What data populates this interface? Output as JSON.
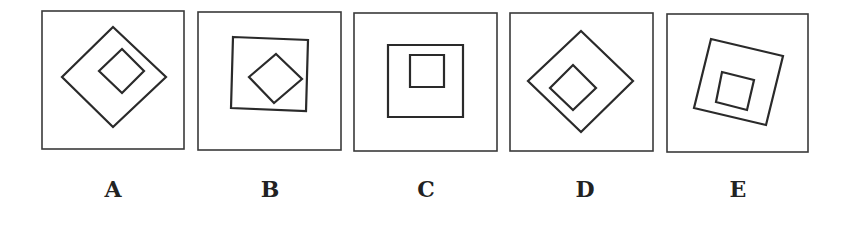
{
  "figure": {
    "options": [
      {
        "label": "A",
        "frame": {
          "x": 42,
          "y": 11,
          "w": 142,
          "h": 138
        },
        "shapes": [
          {
            "type": "diamond",
            "points": [
              [
                113,
                27
              ],
              [
                166,
                77
              ],
              [
                113,
                127
              ],
              [
                62,
                77
              ]
            ]
          },
          {
            "type": "diamond",
            "points": [
              [
                122,
                49
              ],
              [
                144,
                71
              ],
              [
                122,
                93
              ],
              [
                99,
                71
              ]
            ]
          }
        ]
      },
      {
        "label": "B",
        "frame": {
          "x": 198,
          "y": 12,
          "w": 143,
          "h": 138
        },
        "shapes": [
          {
            "type": "square",
            "points": [
              [
                233,
                37
              ],
              [
                308,
                40
              ],
              [
                306,
                111
              ],
              [
                231,
                108
              ]
            ]
          },
          {
            "type": "diamond",
            "points": [
              [
                276,
                54
              ],
              [
                302,
                79
              ],
              [
                274,
                103
              ],
              [
                249,
                77
              ]
            ]
          }
        ]
      },
      {
        "label": "C",
        "frame": {
          "x": 354,
          "y": 13,
          "w": 143,
          "h": 138
        },
        "shapes": [
          {
            "type": "square",
            "points": [
              [
                388,
                45
              ],
              [
                463,
                45
              ],
              [
                463,
                117
              ],
              [
                388,
                117
              ]
            ]
          },
          {
            "type": "square",
            "points": [
              [
                410,
                55
              ],
              [
                444,
                55
              ],
              [
                444,
                87
              ],
              [
                410,
                87
              ]
            ]
          }
        ]
      },
      {
        "label": "D",
        "frame": {
          "x": 510,
          "y": 13,
          "w": 143,
          "h": 138
        },
        "shapes": [
          {
            "type": "diamond",
            "points": [
              [
                581,
                31
              ],
              [
                633,
                81
              ],
              [
                581,
                132
              ],
              [
                528,
                81
              ]
            ]
          },
          {
            "type": "diamond",
            "points": [
              [
                573,
                65
              ],
              [
                596,
                88
              ],
              [
                573,
                110
              ],
              [
                550,
                88
              ]
            ]
          }
        ]
      },
      {
        "label": "E",
        "frame": {
          "x": 667,
          "y": 14,
          "w": 141,
          "h": 138
        },
        "shapes": [
          {
            "type": "square",
            "points": [
              [
                711,
                39
              ],
              [
                783,
                56
              ],
              [
                766,
                125
              ],
              [
                694,
                108
              ]
            ]
          },
          {
            "type": "square",
            "points": [
              [
                722,
                72
              ],
              [
                754,
                80
              ],
              [
                747,
                110
              ],
              [
                716,
                102
              ]
            ]
          }
        ]
      }
    ],
    "label_centers_x": [
      113,
      270,
      426,
      585,
      738
    ]
  }
}
